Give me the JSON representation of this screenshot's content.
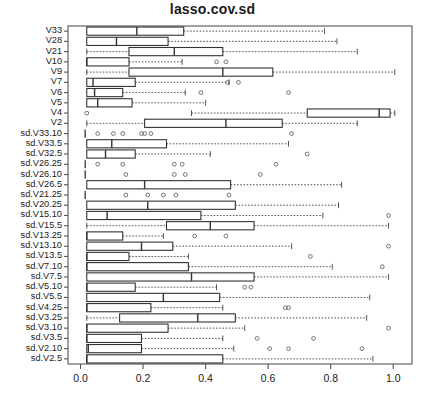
{
  "title": "lasso.cov.sd",
  "colors": {
    "frame": "#555555",
    "box": "#333333",
    "whisker": "#555555",
    "outlier": "#666666",
    "background": "#ffffff",
    "text": "#1a1a1a"
  },
  "axis": {
    "x_label": "",
    "y_label": "",
    "x_ticks": [
      "0.0",
      "0.2",
      "0.4",
      "0.6",
      "0.8",
      "1.0"
    ],
    "x_tick_values": [
      0.0,
      0.2,
      0.4,
      0.6,
      0.8,
      1.0
    ],
    "xlim": [
      -0.04,
      1.06
    ],
    "grid": false
  },
  "chart_data": {
    "type": "boxplot",
    "title": "lasso.cov.sd",
    "xlabel": "",
    "ylabel": "",
    "xlim": [
      -0.04,
      1.06
    ],
    "grid": false,
    "orientation": "horizontal",
    "categories": [
      "V33",
      "V28",
      "V21",
      "V10",
      "V9",
      "V7",
      "V6",
      "V5",
      "V4",
      "V2",
      "sd.V33.10",
      "sd.V33.5",
      "sd.V32.5",
      "sd.V26.25",
      "sd.V26.10",
      "sd.V26.5",
      "sd.V21.25",
      "sd.V20.25",
      "sd.V15.10",
      "sd.V15.5",
      "sd.V13.25",
      "sd.V13.10",
      "sd.V13.5",
      "sd.V7.10",
      "sd.V7.5",
      "sd.V5.10",
      "sd.V5.5",
      "sd.V4.25",
      "sd.V3.25",
      "sd.V3.10",
      "sd.V3.5",
      "sd.V2.10",
      "sd.V2.5"
    ],
    "boxes": [
      {
        "label": "V33",
        "lower_whisker": 0.02,
        "q1": 0.02,
        "median": 0.18,
        "q3": 0.33,
        "upper_whisker": 0.78,
        "outliers": []
      },
      {
        "label": "V28",
        "lower_whisker": 0.02,
        "q1": 0.02,
        "median": 0.115,
        "q3": 0.28,
        "upper_whisker": 0.82,
        "outliers": []
      },
      {
        "label": "V21",
        "lower_whisker": 0.02,
        "q1": 0.155,
        "median": 0.3,
        "q3": 0.455,
        "upper_whisker": 0.885,
        "outliers": []
      },
      {
        "label": "V10",
        "lower_whisker": 0.02,
        "q1": 0.02,
        "median": 0.02,
        "q3": 0.155,
        "upper_whisker": 0.325,
        "outliers": [
          0.435,
          0.465
        ]
      },
      {
        "label": "V9",
        "lower_whisker": 0.02,
        "q1": 0.155,
        "median": 0.455,
        "q3": 0.615,
        "upper_whisker": 1.005,
        "outliers": []
      },
      {
        "label": "V7",
        "lower_whisker": 0.02,
        "q1": 0.02,
        "median": 0.04,
        "q3": 0.175,
        "upper_whisker": 0.475,
        "outliers": [
          0.47,
          0.505
        ]
      },
      {
        "label": "V6",
        "lower_whisker": 0.02,
        "q1": 0.02,
        "median": 0.045,
        "q3": 0.135,
        "upper_whisker": 0.335,
        "outliers": [
          0.385,
          0.665
        ]
      },
      {
        "label": "V5",
        "lower_whisker": 0.02,
        "q1": 0.02,
        "median": 0.055,
        "q3": 0.165,
        "upper_whisker": 0.4,
        "outliers": []
      },
      {
        "label": "V4",
        "lower_whisker": 0.355,
        "q1": 0.725,
        "median": 0.955,
        "q3": 0.99,
        "upper_whisker": 1.005,
        "outliers": [
          0.02
        ]
      },
      {
        "label": "V2",
        "lower_whisker": 0.02,
        "q1": 0.205,
        "median": 0.465,
        "q3": 0.645,
        "upper_whisker": 0.885,
        "outliers": []
      },
      {
        "label": "sd.V33.10",
        "lower_whisker": 0.015,
        "q1": 0.015,
        "median": 0.015,
        "q3": 0.015,
        "upper_whisker": 0.015,
        "outliers": [
          0.055,
          0.105,
          0.135,
          0.195,
          0.205,
          0.225,
          0.675
        ]
      },
      {
        "label": "sd.V33.5",
        "lower_whisker": 0.02,
        "q1": 0.02,
        "median": 0.1,
        "q3": 0.275,
        "upper_whisker": 0.665,
        "outliers": []
      },
      {
        "label": "sd.V32.5",
        "lower_whisker": 0.02,
        "q1": 0.02,
        "median": 0.08,
        "q3": 0.175,
        "upper_whisker": 0.415,
        "outliers": [
          0.725
        ]
      },
      {
        "label": "sd.V26.25",
        "lower_whisker": 0.015,
        "q1": 0.015,
        "median": 0.015,
        "q3": 0.015,
        "upper_whisker": 0.015,
        "outliers": [
          0.055,
          0.135,
          0.3,
          0.325,
          0.625
        ]
      },
      {
        "label": "sd.V26.10",
        "lower_whisker": 0.015,
        "q1": 0.015,
        "median": 0.015,
        "q3": 0.015,
        "upper_whisker": 0.015,
        "outliers": [
          0.145,
          0.3,
          0.335,
          0.575
        ]
      },
      {
        "label": "sd.V26.5",
        "lower_whisker": 0.02,
        "q1": 0.02,
        "median": 0.205,
        "q3": 0.48,
        "upper_whisker": 0.835,
        "outliers": []
      },
      {
        "label": "sd.V21.25",
        "lower_whisker": 0.015,
        "q1": 0.015,
        "median": 0.015,
        "q3": 0.015,
        "upper_whisker": 0.015,
        "outliers": [
          0.145,
          0.215,
          0.265,
          0.305,
          0.475
        ]
      },
      {
        "label": "sd.V20.25",
        "lower_whisker": 0.02,
        "q1": 0.02,
        "median": 0.215,
        "q3": 0.495,
        "upper_whisker": 0.825,
        "outliers": []
      },
      {
        "label": "sd.V15.10",
        "lower_whisker": 0.02,
        "q1": 0.02,
        "median": 0.085,
        "q3": 0.385,
        "upper_whisker": 0.775,
        "outliers": [
          0.985
        ]
      },
      {
        "label": "sd.V15.5",
        "lower_whisker": 0.02,
        "q1": 0.275,
        "median": 0.415,
        "q3": 0.555,
        "upper_whisker": 0.985,
        "outliers": []
      },
      {
        "label": "sd.V13.25",
        "lower_whisker": 0.02,
        "q1": 0.02,
        "median": 0.02,
        "q3": 0.135,
        "upper_whisker": 0.265,
        "outliers": [
          0.365,
          0.465
        ]
      },
      {
        "label": "sd.V13.10",
        "lower_whisker": 0.02,
        "q1": 0.02,
        "median": 0.195,
        "q3": 0.295,
        "upper_whisker": 0.675,
        "outliers": [
          0.985
        ]
      },
      {
        "label": "sd.V13.5",
        "lower_whisker": 0.02,
        "q1": 0.02,
        "median": 0.02,
        "q3": 0.155,
        "upper_whisker": 0.345,
        "outliers": [
          0.735
        ]
      },
      {
        "label": "sd.V7.10",
        "lower_whisker": 0.02,
        "q1": 0.02,
        "median": 0.02,
        "q3": 0.345,
        "upper_whisker": 0.805,
        "outliers": [
          0.965
        ]
      },
      {
        "label": "sd.V7.5",
        "lower_whisker": 0.02,
        "q1": 0.02,
        "median": 0.355,
        "q3": 0.555,
        "upper_whisker": 0.985,
        "outliers": []
      },
      {
        "label": "sd.V5.10",
        "lower_whisker": 0.02,
        "q1": 0.02,
        "median": 0.02,
        "q3": 0.175,
        "upper_whisker": 0.435,
        "outliers": [
          0.525,
          0.545
        ]
      },
      {
        "label": "sd.V5.5",
        "lower_whisker": 0.02,
        "q1": 0.02,
        "median": 0.265,
        "q3": 0.445,
        "upper_whisker": 0.925,
        "outliers": []
      },
      {
        "label": "sd.V4.25",
        "lower_whisker": 0.02,
        "q1": 0.02,
        "median": 0.02,
        "q3": 0.225,
        "upper_whisker": 0.455,
        "outliers": [
          0.655,
          0.665
        ]
      },
      {
        "label": "sd.V3.25",
        "lower_whisker": 0.02,
        "q1": 0.125,
        "median": 0.375,
        "q3": 0.495,
        "upper_whisker": 0.915,
        "outliers": []
      },
      {
        "label": "sd.V3.10",
        "lower_whisker": 0.02,
        "q1": 0.02,
        "median": 0.02,
        "q3": 0.28,
        "upper_whisker": 0.525,
        "outliers": [
          0.985
        ]
      },
      {
        "label": "sd.V3.5",
        "lower_whisker": 0.02,
        "q1": 0.02,
        "median": 0.02,
        "q3": 0.195,
        "upper_whisker": 0.455,
        "outliers": [
          0.565,
          0.745
        ]
      },
      {
        "label": "sd.V2.10",
        "lower_whisker": 0.02,
        "q1": 0.02,
        "median": 0.025,
        "q3": 0.195,
        "upper_whisker": 0.49,
        "outliers": [
          0.605,
          0.665,
          0.9
        ]
      },
      {
        "label": "sd.V2.5",
        "lower_whisker": 0.02,
        "q1": 0.02,
        "median": 0.02,
        "q3": 0.455,
        "upper_whisker": 0.935,
        "outliers": []
      }
    ]
  }
}
